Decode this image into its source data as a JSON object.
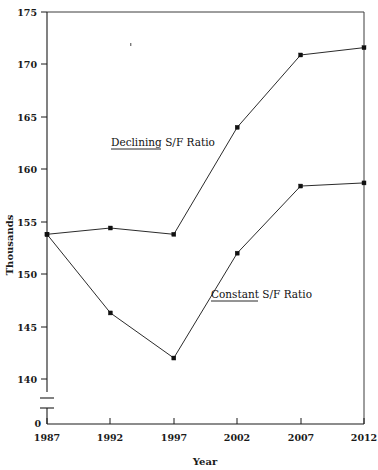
{
  "chart_data": {
    "type": "line",
    "title": "",
    "xlabel": "Year",
    "ylabel": "Thousands",
    "x": [
      1987,
      1992,
      1997,
      2002,
      2007,
      2012
    ],
    "categories": [
      "1987",
      "1992",
      "1997",
      "2002",
      "2007",
      "2012"
    ],
    "series": [
      {
        "name": "Declining S/F Ratio",
        "values": [
          153.8,
          154.4,
          153.8,
          164.0,
          170.9,
          171.6
        ],
        "marker": "square",
        "color": "#2b2b2b"
      },
      {
        "name": "Constant S/F Ratio",
        "values": [
          153.8,
          146.3,
          142.0,
          152.0,
          158.4,
          158.7
        ],
        "marker": "square",
        "color": "#2b2b2b"
      }
    ],
    "ylim": [
      140,
      175
    ],
    "yticks": [
      140,
      145,
      150,
      155,
      160,
      165,
      170,
      175
    ],
    "ytick_labels": [
      "140",
      "145",
      "150",
      "155",
      "160",
      "165",
      "170",
      "175"
    ],
    "y_axis_break": true,
    "y_break_label": "0",
    "xlim": [
      1987,
      2012
    ],
    "xticks": [
      1987,
      1992,
      1997,
      2002,
      2007,
      2012
    ],
    "xtick_labels": [
      "1987",
      "1992",
      "1997",
      "2002",
      "2007",
      "2012"
    ],
    "grid": false,
    "legend": "inline-annotations",
    "annotations": [
      {
        "text": "Declining S/F Ratio",
        "underlined_prefix": "Declining",
        "rest": " S/F Ratio",
        "x": 111,
        "y": 146
      },
      {
        "text": "Constant S/F Ratio",
        "underlined_prefix": "Constant",
        "rest": " S/F Ratio",
        "x": 211,
        "y": 298
      }
    ]
  },
  "axes": {
    "y_title": "Thousands",
    "x_title": "Year",
    "zero_label": "0"
  }
}
